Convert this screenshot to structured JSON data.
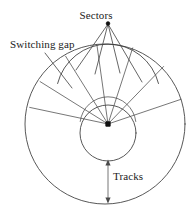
{
  "figure": {
    "background_color": "#ffffff",
    "line_color": "#3a3a3a",
    "text_color": "#1b1b1b",
    "width": 194,
    "height": 212
  },
  "labels": {
    "sectors": "Sectors",
    "switching_gap": "Switching gap",
    "tracks": "Tracks"
  },
  "geometry": {
    "outer_circle": {
      "cx": 105,
      "cy": 124,
      "r": 80
    },
    "inner_circle": {
      "cx": 108,
      "cy": 133,
      "r": 28
    },
    "middle_arc_radius": 52,
    "hub_dot": {
      "cx": 108,
      "cy": 124,
      "size": 4
    },
    "sector_count": 6,
    "sector_line_angles_deg": [
      -168,
      -148,
      -122,
      -98,
      -72,
      -46,
      -18
    ],
    "tracks_arrow": {
      "x": 108,
      "y_top": 161,
      "y_bottom": 202
    }
  },
  "leaders": {
    "sectors_apex": {
      "x": 108,
      "y": 22
    },
    "sectors_line_endpoints": [
      {
        "x": 76,
        "y": 70
      },
      {
        "x": 95,
        "y": 74
      },
      {
        "x": 120,
        "y": 73
      },
      {
        "x": 142,
        "y": 82
      }
    ],
    "switching_gap_line": {
      "x1": 45,
      "y1": 53,
      "x2": 72,
      "y2": 88
    }
  }
}
